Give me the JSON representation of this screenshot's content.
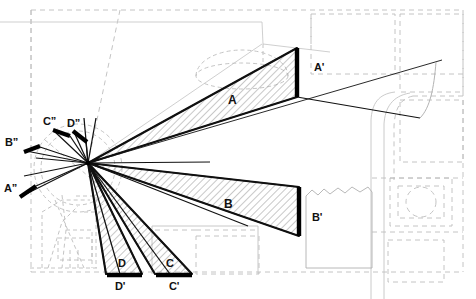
{
  "figure": {
    "type": "isovist-visibility-diagram",
    "background": "#ffffff",
    "ink": "#111111",
    "plan_line_color": "#b8b8b8",
    "hatch_color": "#9a9a9a",
    "width": 476,
    "height": 299
  },
  "viewpoint": {
    "x": 88,
    "y": 163,
    "name": "observer-station-point"
  },
  "labels": {
    "wedge_a": "A",
    "wedge_b": "B",
    "wedge_c": "C",
    "wedge_d": "D",
    "target_a": "A'",
    "target_b": "B'",
    "target_c": "C'",
    "target_d": "D'",
    "proj_a": "A”",
    "proj_b": "B”",
    "proj_c": "C”",
    "proj_d": "D”"
  },
  "label_positions": {
    "wedge_a": {
      "x": 228,
      "y": 100
    },
    "wedge_b": {
      "x": 224,
      "y": 204
    },
    "wedge_c": {
      "x": 166,
      "y": 264
    },
    "wedge_d": {
      "x": 118,
      "y": 264
    },
    "target_a": {
      "x": 314,
      "y": 68
    },
    "target_b": {
      "x": 312,
      "y": 218
    },
    "target_c": {
      "x": 171,
      "y": 286
    },
    "target_d": {
      "x": 117,
      "y": 286
    },
    "proj_a": {
      "x": 5,
      "y": 188
    },
    "proj_b": {
      "x": 6,
      "y": 142
    },
    "proj_c": {
      "x": 44,
      "y": 122
    },
    "proj_d": {
      "x": 68,
      "y": 124
    }
  },
  "wedges": [
    {
      "name": "wedge-a",
      "label": "A",
      "hatched": true,
      "points": "88,163 297,48 297,97",
      "end_bar": {
        "x1": 297,
        "y1": 48,
        "x2": 297,
        "y2": 97
      }
    },
    {
      "name": "wedge-b",
      "label": "B",
      "hatched": true,
      "points": "88,163 299,187 299,236",
      "end_bar": {
        "x1": 299,
        "y1": 187,
        "x2": 299,
        "y2": 236
      }
    },
    {
      "name": "wedge-c",
      "label": "C",
      "hatched": true,
      "points": "88,163 155,274 192,274",
      "end_bar": {
        "x1": 155,
        "y1": 274,
        "x2": 192,
        "y2": 274
      }
    },
    {
      "name": "wedge-d",
      "label": "D",
      "hatched": true,
      "points": "88,163 106,274 142,274",
      "end_bar": {
        "x1": 106,
        "y1": 274,
        "x2": 142,
        "y2": 274
      }
    }
  ],
  "projection_bars": [
    {
      "name": "proj-bar-a",
      "label": "A”",
      "x1": 20,
      "y1": 197,
      "x2": 36,
      "y2": 186
    },
    {
      "name": "proj-bar-b",
      "label": "B”",
      "x1": 24,
      "y1": 151,
      "x2": 39,
      "y2": 146
    },
    {
      "name": "proj-bar-c",
      "label": "C”",
      "x1": 53,
      "y1": 130,
      "x2": 70,
      "y2": 135
    },
    {
      "name": "proj-bar-d",
      "label": "D”",
      "x1": 73,
      "y1": 131,
      "x2": 86,
      "y2": 142
    }
  ],
  "sight_lines": {
    "count": 24,
    "description": "radiating sight lines from the station point to wedge edges"
  },
  "site_plan": {
    "description": "dashed architectural site plan underlay with building footprints, a domed rotunda, curved path and irregular boundary"
  }
}
